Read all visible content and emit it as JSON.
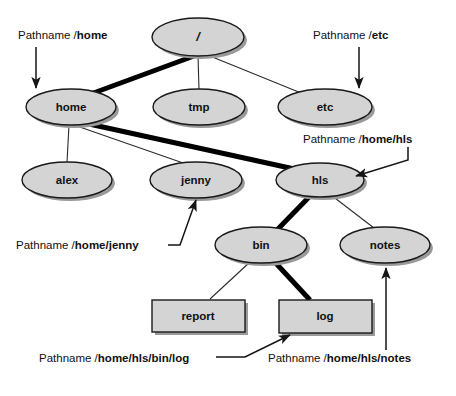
{
  "diagram": {
    "colors": {
      "node_fill": "#d4d4d4",
      "node_stroke": "#1a1a1a",
      "shadow": "#9a9a9a",
      "edge": "#2b2b2b",
      "highlight_edge": "#000000",
      "text": "#111111",
      "background": "#ffffff"
    },
    "nodes": [
      {
        "id": "root",
        "label": "/",
        "shape": "ellipse",
        "cx": 198,
        "cy": 37,
        "rx": 46,
        "ry": 19
      },
      {
        "id": "home",
        "label": "home",
        "shape": "ellipse",
        "cx": 71,
        "cy": 107,
        "rx": 45,
        "ry": 18
      },
      {
        "id": "tmp",
        "label": "tmp",
        "shape": "ellipse",
        "cx": 199,
        "cy": 107,
        "rx": 46,
        "ry": 18
      },
      {
        "id": "etc",
        "label": "etc",
        "shape": "ellipse",
        "cx": 325,
        "cy": 107,
        "rx": 47,
        "ry": 18
      },
      {
        "id": "alex",
        "label": "alex",
        "shape": "ellipse",
        "cx": 67,
        "cy": 180,
        "rx": 45,
        "ry": 18
      },
      {
        "id": "jenny",
        "label": "jenny",
        "shape": "ellipse",
        "cx": 196,
        "cy": 180,
        "rx": 46,
        "ry": 18
      },
      {
        "id": "hls",
        "label": "hls",
        "shape": "ellipse",
        "cx": 320,
        "cy": 180,
        "rx": 44,
        "ry": 17
      },
      {
        "id": "bin",
        "label": "bin",
        "shape": "ellipse",
        "cx": 261,
        "cy": 245,
        "rx": 46,
        "ry": 18
      },
      {
        "id": "notes",
        "label": "notes",
        "shape": "ellipse",
        "cx": 385,
        "cy": 245,
        "rx": 45,
        "ry": 18
      },
      {
        "id": "report",
        "label": "report",
        "shape": "rectangle",
        "x": 152,
        "y": 300,
        "w": 93,
        "h": 32
      },
      {
        "id": "log",
        "label": "log",
        "shape": "rectangle",
        "x": 279,
        "y": 300,
        "w": 93,
        "h": 33
      }
    ],
    "edges": [
      {
        "from": "root",
        "to": "home",
        "highlighted": true
      },
      {
        "from": "root",
        "to": "tmp",
        "highlighted": false
      },
      {
        "from": "root",
        "to": "etc",
        "highlighted": false
      },
      {
        "from": "home",
        "to": "alex",
        "highlighted": false
      },
      {
        "from": "home",
        "to": "jenny",
        "highlighted": false
      },
      {
        "from": "home",
        "to": "hls",
        "highlighted": true
      },
      {
        "from": "hls",
        "to": "bin",
        "highlighted": true
      },
      {
        "from": "hls",
        "to": "notes",
        "highlighted": false
      },
      {
        "from": "bin",
        "to": "report",
        "highlighted": false
      },
      {
        "from": "bin",
        "to": "log",
        "highlighted": true
      }
    ],
    "annotations": [
      {
        "id": "ann-home",
        "prefix": "Pathname /",
        "path": "home",
        "target": "home",
        "x": 18,
        "y": 29
      },
      {
        "id": "ann-etc",
        "prefix": "Pathname /",
        "path": "etc",
        "target": "etc",
        "x": 313,
        "y": 29
      },
      {
        "id": "ann-home-hls",
        "prefix": "Pathname /",
        "path": "home/hls",
        "target": "hls",
        "x": 303,
        "y": 133
      },
      {
        "id": "ann-home-jenny",
        "prefix": "Pathname /",
        "path": "home/jenny",
        "target": "jenny",
        "x": 16,
        "y": 239
      },
      {
        "id": "ann-bin-log",
        "prefix": "Pathname /",
        "path": "home/hls/bin/log",
        "target": "log",
        "x": 39,
        "y": 358
      },
      {
        "id": "ann-hls-notes",
        "prefix": "Pathname /",
        "path": "home/hls/notes",
        "target": "notes",
        "x": 268,
        "y": 358
      }
    ]
  }
}
